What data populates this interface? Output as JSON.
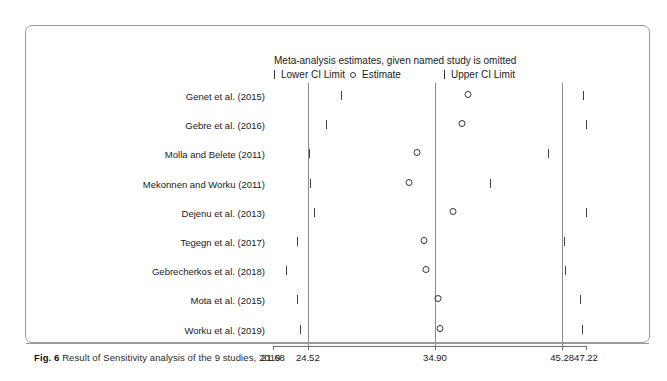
{
  "figure": {
    "number_label": "Fig. 6",
    "caption": "Result of Sensitivity analysis of the 9 studies, 2019"
  },
  "chart_data": {
    "type": "scatter",
    "title": "Meta-analysis estimates, given named study is omitted",
    "xlabel": "",
    "ylabel": "",
    "xlim": [
      21.68,
      47.22
    ],
    "grid": false,
    "legend_position": "top",
    "legend": [
      {
        "marker": "tick",
        "label": "Lower CI Limit"
      },
      {
        "marker": "circle",
        "label": "Estimate"
      },
      {
        "marker": "tick",
        "label": "Upper CI Limit"
      }
    ],
    "axis_ticks": [
      21.68,
      24.52,
      34.9,
      45.28,
      47.22
    ],
    "axis_tick_labels": [
      "21.68",
      "24.52",
      "34.90",
      "45.28",
      "47.22"
    ],
    "reference_lines": [
      24.52,
      34.9,
      45.28
    ],
    "categories": [
      "Genet et al.   (2015)",
      "Gebre et al.  (2016)",
      "Molla and Belete (2011)",
      "Mekonnen and Worku  (2011)",
      "Dejenu et al. (2013)",
      "Tegegn et al. (2017)",
      "Gebrecherkos et al. (2018)",
      "Mota et al. (2015)",
      "Worku et al. (2019)"
    ],
    "series": [
      {
        "name": "Lower CI Limit",
        "values": [
          27.2,
          26.0,
          24.6,
          24.7,
          25.0,
          23.6,
          22.7,
          23.6,
          23.9
        ]
      },
      {
        "name": "Estimate",
        "values": [
          37.6,
          37.1,
          33.4,
          32.8,
          36.4,
          34.0,
          34.2,
          35.1,
          35.3
        ]
      },
      {
        "name": "Upper CI Limit",
        "values": [
          47.0,
          47.2,
          44.1,
          39.4,
          47.2,
          45.4,
          45.5,
          46.7,
          46.9
        ]
      }
    ]
  }
}
